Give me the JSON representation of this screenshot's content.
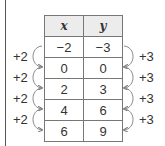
{
  "table": {
    "headers": [
      "x",
      "y"
    ],
    "rows": [
      [
        "−2",
        "−3"
      ],
      [
        "0",
        "0"
      ],
      [
        "2",
        "3"
      ],
      [
        "4",
        "6"
      ],
      [
        "6",
        "9"
      ]
    ]
  },
  "left_annotations": [
    "+2",
    "+2",
    "+2",
    "+2"
  ],
  "right_annotations": [
    "+3",
    "+3",
    "+3",
    "+3"
  ],
  "colors": {
    "header_bg": "#ececec",
    "border": "#777777",
    "arc": "#777777"
  }
}
